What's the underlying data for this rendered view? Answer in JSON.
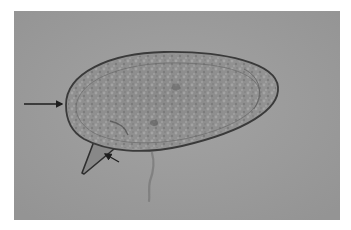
{
  "figure": {
    "type": "light-micrograph",
    "background_color": "#9c9c9c",
    "annotations": [
      {
        "id": "arrow-shell",
        "kind": "arrow",
        "points_to": "egg shell edge (left pole)"
      },
      {
        "id": "arrow-spine",
        "kind": "arrow",
        "points_to": "spine"
      }
    ],
    "colors": {
      "field": "#9c9c9c",
      "egg_fill": "#8e8e8e",
      "egg_outline": "#3a3a3a",
      "arrow": "#1e1e1e"
    }
  }
}
